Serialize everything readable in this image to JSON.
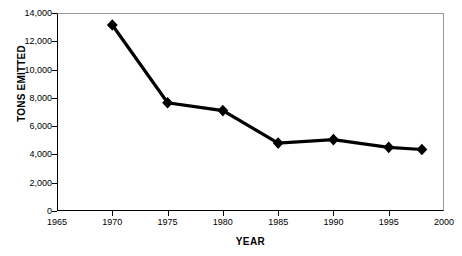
{
  "chart_data": {
    "type": "line",
    "title": "",
    "xlabel": "YEAR",
    "ylabel": "TONS EMITTED",
    "x": [
      1970,
      1975,
      1980,
      1985,
      1990,
      1995,
      1998
    ],
    "values": [
      13150,
      7650,
      7100,
      4800,
      5050,
      4500,
      4350
    ],
    "series": [
      {
        "name": "Tons Emitted",
        "values": [
          13150,
          7650,
          7100,
          4800,
          5050,
          4500,
          4350
        ],
        "color": "#000000",
        "marker": "diamond"
      }
    ],
    "xlim": [
      1965,
      2000
    ],
    "ylim": [
      0,
      14000
    ],
    "xticks": [
      1965,
      1970,
      1975,
      1980,
      1985,
      1990,
      1995,
      2000
    ],
    "xtick_labels": [
      "1965",
      "1970",
      "1975",
      "1980",
      "1985",
      "1990",
      "1995",
      "2000"
    ],
    "yticks": [
      0,
      2000,
      4000,
      6000,
      8000,
      10000,
      12000,
      14000
    ],
    "ytick_labels": [
      "0",
      "2,000",
      "4,000",
      "6,000",
      "8,000",
      "10,000",
      "12,000",
      "14,000"
    ],
    "grid": false,
    "legend": false,
    "legend_position": "none"
  }
}
